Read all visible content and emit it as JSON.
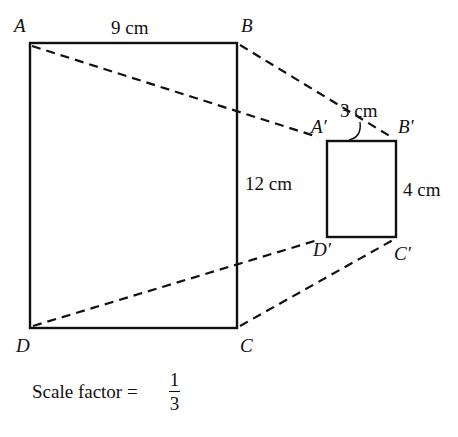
{
  "diagram": {
    "type": "enlargement / reduction with centre of projection",
    "large_rectangle": {
      "vertices": {
        "A": "A",
        "B": "B",
        "C": "C",
        "D": "D"
      },
      "top_length": "9 cm",
      "right_length": "12 cm"
    },
    "small_rectangle": {
      "vertices": {
        "A": "A′",
        "B": "B′",
        "C": "C′",
        "D": "D′"
      },
      "top_length": "3 cm",
      "right_length": "4 cm"
    },
    "caption": {
      "text": "Scale factor = ",
      "numerator": "1",
      "denominator": "3"
    },
    "colors": {
      "line": "#111111",
      "background": "#ffffff"
    }
  }
}
